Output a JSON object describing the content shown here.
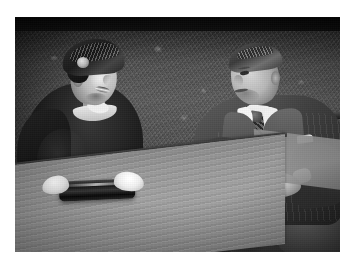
{
  "image": {
    "kind": "photograph",
    "medium": "black-and-white press photograph",
    "border_color": "#ffffff",
    "orientation": "landscape",
    "tone": "monochrome grayscale",
    "subject_summary": "A man and a woman seated outdoors at a wooden garden table in front of a hedge",
    "scene": {
      "setting": "garden / outdoors",
      "background": "dense dark hedge or foliage wall with dark band across the top",
      "foreground": "light wooden table top angled across the lower left"
    },
    "people": [
      {
        "id": "woman",
        "position": "left",
        "pose": "seated, turned toward the man, smiling",
        "head": "tilted, looking toward the right",
        "clothing": [
          "dark draped pillbox-style hat with decorative brooch",
          "dark tailored jacket",
          "white collar at the neck",
          "white gloves"
        ],
        "hands": "white-gloved hands resting on a dark rectangular box or handbag on the table"
      },
      {
        "id": "man",
        "position": "right",
        "pose": "seated, leaning slightly forward, looking down",
        "head": "tilted downward, eyes lowered",
        "clothing": [
          "dark pinstriped double-breasted suit",
          "light shirt with pointed collar",
          "patterned necktie",
          "white pocket square in breast pocket",
          "white shirt cuffs"
        ],
        "hands": "hands clasped together over his lap"
      }
    ],
    "objects": [
      {
        "name": "wooden table",
        "description": "light-toned wooden table top with visible grain, angled across the lower left of the frame"
      },
      {
        "name": "dark box",
        "description": "dark rectangular box or handbag on the table beneath the woman's gloved hands"
      },
      {
        "name": "bench",
        "description": "dark wooden bench or chair back visible at the right edge behind the man"
      },
      {
        "name": "hedge",
        "description": "textured hedge wall filling the background"
      }
    ],
    "colors": {
      "highlight_white": "#ffffff",
      "table_wood": "#a5a396",
      "hedge_mid": "#5d6055",
      "suit_dark": "#3a3833",
      "shadow_black": "#141410"
    },
    "text_content": "none"
  }
}
